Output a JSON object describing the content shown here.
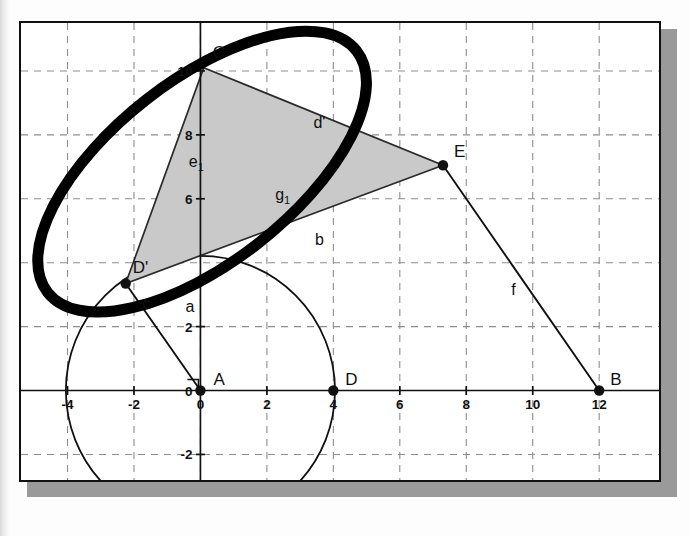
{
  "figure": {
    "colors": {
      "ink": "#111111",
      "grid": "#8d8d8d",
      "triangle_fill": "#c9c9c9",
      "ellipse": "#000000",
      "shadow": "#9a9a9a",
      "paper": "#ffffff"
    },
    "axes": {
      "x_label_values": [
        "-4",
        "-2",
        "0",
        "2",
        "4",
        "6",
        "8",
        "10",
        "12"
      ],
      "x_label_numbers": [
        -4,
        -2,
        0,
        2,
        4,
        6,
        8,
        10,
        12
      ],
      "y_label_values": [
        "10",
        "8",
        "6",
        "2",
        "0",
        "-2"
      ],
      "y_label_numbers": [
        10,
        8,
        6,
        2,
        0,
        -2
      ],
      "x_range": [
        -5.4,
        13.8
      ],
      "y_range": [
        -2.8,
        11.5
      ],
      "grid": "dashed",
      "units_per_gridline": 2
    },
    "points": [
      {
        "name": "A",
        "label": "A",
        "x": 0,
        "y": 0,
        "filled": true,
        "label_dx": 13,
        "label_dy": -6
      },
      {
        "name": "D",
        "label": "D",
        "x": 4,
        "y": 0,
        "filled": true,
        "label_dx": 12,
        "label_dy": -6
      },
      {
        "name": "B",
        "label": "B",
        "x": 12,
        "y": 0,
        "filled": true,
        "label_dx": 11,
        "label_dy": -6
      },
      {
        "name": "E",
        "label": "E",
        "x": 7.3,
        "y": 7.05,
        "filled": true,
        "label_dx": 11,
        "label_dy": -8
      },
      {
        "name": "C",
        "label": "C",
        "x": 0.1,
        "y": 10.1,
        "filled": false,
        "label_dx": 9,
        "label_dy": -10
      },
      {
        "name": "Dp",
        "label": "D'",
        "x": -2.25,
        "y": 3.35,
        "filled": true,
        "label_dx": 7,
        "label_dy": -10
      }
    ],
    "segments": [
      {
        "name": "b",
        "label": "b",
        "label_x": 3.45,
        "label_y": 4.55
      },
      {
        "name": "f",
        "label": "f",
        "label_x": 9.35,
        "label_y": 3.0
      },
      {
        "name": "c",
        "label": "c",
        "label_x": -1.75,
        "label_y": 2.55
      },
      {
        "name": "a",
        "label": "a",
        "label_x": -0.45,
        "label_y": 2.45
      },
      {
        "name": "d'",
        "label": "d'",
        "label_x": 3.4,
        "label_y": 8.2
      },
      {
        "name": "e1",
        "label": "e",
        "sub": "1",
        "label_x": -0.35,
        "label_y": 7.0
      },
      {
        "name": "g1",
        "label": "g",
        "sub": "1",
        "label_x": 2.25,
        "label_y": 5.95
      }
    ],
    "circle": {
      "name": "circle-a",
      "cx": 0,
      "cy": 0,
      "r": 4.05
    },
    "ellipse": {
      "name": "ellipse",
      "cx": 0.05,
      "cy": 6.85,
      "rx": 5.9,
      "ry": 2.85,
      "rotation_deg": -38,
      "stroke_width": 11
    },
    "triangle": {
      "name": "triangle-cde",
      "vertices": [
        "C",
        "E",
        "Dp"
      ]
    }
  }
}
